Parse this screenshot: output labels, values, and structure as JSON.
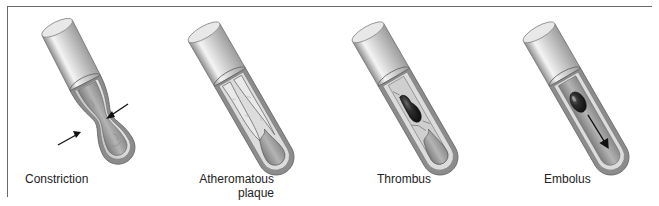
{
  "figure": {
    "panels": [
      {
        "id": "constriction",
        "label": "Constriction",
        "label_lines": [
          "Constriction"
        ]
      },
      {
        "id": "atheromatous-plaque",
        "label": "Atheromatous plaque",
        "label_lines": [
          "Atheromatous",
          "plaque"
        ]
      },
      {
        "id": "thrombus",
        "label": "Thrombus",
        "label_lines": [
          "Thrombus"
        ]
      },
      {
        "id": "embolus",
        "label": "Embolus",
        "label_lines": [
          "Embolus"
        ]
      }
    ],
    "colors": {
      "frame": "#6a6a6a",
      "outer_wall": "#d9d9d9",
      "wall_highlight": "#f2f2f2",
      "wall_shadow": "#9a9a9a",
      "media_layer": "#8c8c8c",
      "lumen": "#a8a8a8",
      "clot": "#2b2b2b",
      "text": "#222222"
    }
  }
}
